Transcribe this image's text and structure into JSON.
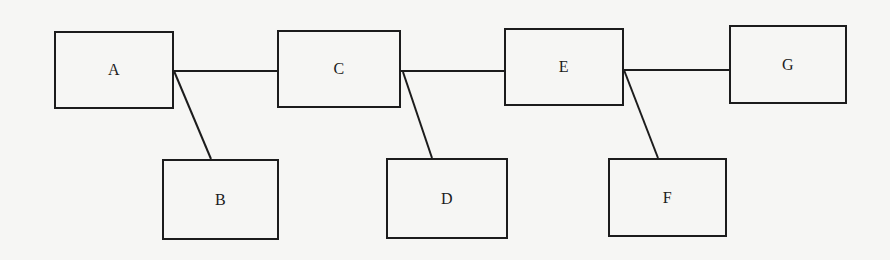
{
  "diagram": {
    "type": "tree-chain",
    "colors": {
      "stroke": "#1c1c1c",
      "background": "#f6f6f4"
    },
    "nodes": [
      {
        "id": "A",
        "label": "A",
        "x": 54,
        "y": 31,
        "w": 120,
        "h": 78
      },
      {
        "id": "B",
        "label": "B",
        "x": 162,
        "y": 159,
        "w": 117,
        "h": 81
      },
      {
        "id": "C",
        "label": "C",
        "x": 277,
        "y": 30,
        "w": 124,
        "h": 78
      },
      {
        "id": "D",
        "label": "D",
        "x": 386,
        "y": 158,
        "w": 122,
        "h": 81
      },
      {
        "id": "E",
        "label": "E",
        "x": 504,
        "y": 28,
        "w": 120,
        "h": 78
      },
      {
        "id": "F",
        "label": "F",
        "x": 608,
        "y": 158,
        "w": 119,
        "h": 79
      },
      {
        "id": "G",
        "label": "G",
        "x": 729,
        "y": 25,
        "w": 118,
        "h": 79
      }
    ],
    "edges": [
      {
        "from": "A",
        "to": "C",
        "x1": 174,
        "y1": 71,
        "x2": 277,
        "y2": 71
      },
      {
        "from": "A",
        "to": "B",
        "x1": 174,
        "y1": 71,
        "x2": 211,
        "y2": 159
      },
      {
        "from": "C",
        "to": "E",
        "x1": 401,
        "y1": 71,
        "x2": 504,
        "y2": 71
      },
      {
        "from": "C",
        "to": "D",
        "x1": 403,
        "y1": 72,
        "x2": 432,
        "y2": 158
      },
      {
        "from": "E",
        "to": "G",
        "x1": 624,
        "y1": 70,
        "x2": 729,
        "y2": 70
      },
      {
        "from": "E",
        "to": "F",
        "x1": 624,
        "y1": 70,
        "x2": 658,
        "y2": 158
      }
    ]
  }
}
